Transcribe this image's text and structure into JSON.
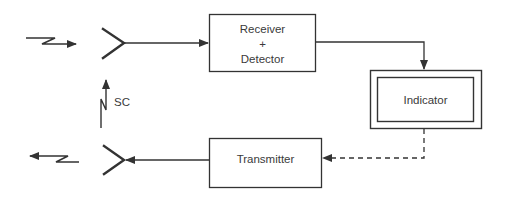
{
  "diagram": {
    "type": "block-diagram",
    "colors": {
      "line": "#333333",
      "text": "#3a3a3a",
      "background": "#ffffff"
    },
    "nodes": [
      {
        "id": "receiver",
        "label_lines": [
          "Receiver",
          "+",
          "Detector"
        ]
      },
      {
        "id": "indicator",
        "label": "Indicator",
        "style": "double-border"
      },
      {
        "id": "transmitter",
        "label": "Transmitter"
      },
      {
        "id": "receive-antenna",
        "label": ""
      },
      {
        "id": "transmit-antenna",
        "label": ""
      }
    ],
    "annotations": {
      "sc_label": "SC"
    },
    "edges": [
      {
        "from": "incoming-signal",
        "to": "receive-antenna",
        "style": "zigzag-arrow"
      },
      {
        "from": "receive-antenna",
        "to": "receiver",
        "style": "solid-arrow"
      },
      {
        "from": "receiver",
        "to": "indicator",
        "style": "solid-arrow"
      },
      {
        "from": "indicator",
        "to": "transmitter",
        "style": "dashed-arrow"
      },
      {
        "from": "transmitter",
        "to": "transmit-antenna",
        "style": "solid-arrow"
      },
      {
        "from": "transmit-antenna",
        "to": "outgoing-signal",
        "style": "zigzag-arrow"
      },
      {
        "from": "transmit-antenna",
        "to": "receive-antenna",
        "style": "zigzag-arrow",
        "label": "SC"
      }
    ]
  }
}
